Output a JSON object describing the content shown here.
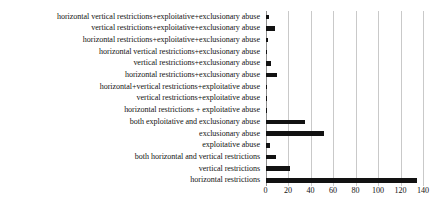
{
  "chart_data": {
    "type": "bar",
    "orientation": "horizontal",
    "title": "",
    "subtitle": "",
    "xlabel": "",
    "ylabel": "",
    "xlim": [
      0,
      140
    ],
    "ylim": null,
    "grid": true,
    "legend": null,
    "legend_position": "none",
    "bar_color": "#121212",
    "gridline_color": "#c9c9c9",
    "axis_color": "#8f8f8f",
    "xticks": [
      0,
      20,
      40,
      60,
      80,
      100,
      120,
      140
    ],
    "xtick_labels": [
      "0",
      "20",
      "40",
      "60",
      "80",
      "100",
      "120",
      "140"
    ],
    "categories": [
      "horizontal vertical restrictions+exploitative+exclusionary abuse",
      "vertical restrictions+exploitative+exclusionary abuse",
      "horizontal restrictions+exploitative+exclusionary abuse",
      "horizontal vertical restrictions+exclusionary abuse",
      "vertical restrictions+exclusionary abuse",
      "horizontal restrictions+exclusionary abuse",
      "horizontal+vertical restrictions+exploitative abuse",
      "vertical restrictions+exploitative abuse",
      "horizontal restrictions + exploitative abuse",
      "both exploitative and exclusionary abuse",
      "exclusionary abuse",
      "exploitative abuse",
      "both horizontal and vertical restrictions",
      "vertical restrictions",
      "horizontal restrictions"
    ],
    "values": [
      3,
      8,
      2,
      1,
      5,
      10,
      0,
      1,
      1,
      35,
      52,
      4,
      9,
      22,
      135
    ]
  }
}
